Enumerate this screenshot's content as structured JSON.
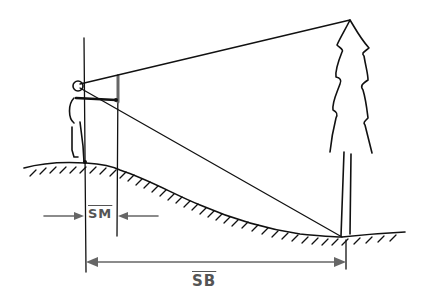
{
  "diagram": {
    "type": "hand-drawn sketch",
    "labels": {
      "sm": "SM",
      "sb": "SB"
    },
    "elements": [
      "observer",
      "sighting-stick",
      "tree",
      "ground-slope",
      "sight-line-to-top",
      "sight-line-to-base",
      "dimension-sm",
      "dimension-sb"
    ],
    "colors": {
      "ink": "#111111",
      "dimension": "#666666",
      "background": "#ffffff"
    }
  }
}
